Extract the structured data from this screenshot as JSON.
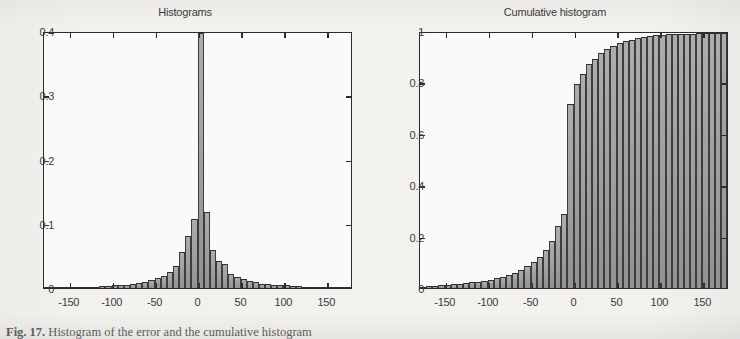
{
  "figure": {
    "caption_label": "Fig. 17.",
    "caption_text": "Histogram of the error and the cumulative histogram"
  },
  "panels": [
    {
      "id": "histograms",
      "title": "Histograms",
      "y_ticks": [
        "0.4",
        "0.3",
        "0.2",
        "0.1",
        "0"
      ],
      "x_ticks": [
        "-150",
        "-100",
        "-50",
        "0",
        "50",
        "100",
        "150"
      ]
    },
    {
      "id": "cumulative-histogram",
      "title": "Cumulative histogram",
      "y_ticks": [
        "1",
        "0.8",
        "0.6",
        "0.4",
        "0.2",
        "0"
      ],
      "x_ticks": [
        "-150",
        "-100",
        "-50",
        "0",
        "50",
        "100",
        "150"
      ]
    }
  ],
  "colors": {
    "bar_fill": "#9b9b9b",
    "bar_edge": "#2e2e2e",
    "axis": "#2b2b2b",
    "paper": "#f3f1ee"
  },
  "chart_data": [
    {
      "type": "bar",
      "title": "Histograms",
      "xlabel": "",
      "ylabel": "",
      "xlim": [
        -180,
        180
      ],
      "ylim": [
        0,
        0.4
      ],
      "grid": false,
      "legend": null,
      "bin_width": 7.2,
      "note": "Central bin is clipped by the axis limit (value exceeds 0.4)",
      "x": [
        -176.4,
        -169.2,
        -162.0,
        -154.8,
        -147.6,
        -140.4,
        -133.2,
        -126.0,
        -118.8,
        -111.6,
        -104.4,
        -97.2,
        -90.0,
        -82.8,
        -75.6,
        -68.4,
        -61.2,
        -54.0,
        -46.8,
        -39.6,
        -32.4,
        -25.2,
        -18.0,
        -10.8,
        -3.6,
        3.6,
        10.8,
        18.0,
        25.2,
        32.4,
        39.6,
        46.8,
        54.0,
        61.2,
        68.4,
        75.6,
        82.8,
        90.0,
        97.2,
        104.4,
        111.6,
        118.8,
        126.0,
        133.2,
        140.4,
        147.6,
        154.8,
        162.0,
        169.2,
        176.4
      ],
      "values": [
        0.001,
        0.001,
        0.001,
        0.001,
        0.001,
        0.002,
        0.002,
        0.002,
        0.002,
        0.003,
        0.003,
        0.004,
        0.004,
        0.005,
        0.006,
        0.008,
        0.01,
        0.013,
        0.016,
        0.019,
        0.025,
        0.035,
        0.056,
        0.082,
        0.108,
        0.4,
        0.12,
        0.06,
        0.043,
        0.038,
        0.022,
        0.017,
        0.014,
        0.011,
        0.009,
        0.007,
        0.006,
        0.005,
        0.004,
        0.004,
        0.003,
        0.003,
        0.002,
        0.002,
        0.002,
        0.002,
        0.001,
        0.001,
        0.001,
        0.001
      ]
    },
    {
      "type": "bar",
      "title": "Cumulative histogram",
      "xlabel": "",
      "ylabel": "",
      "xlim": [
        -180,
        180
      ],
      "ylim": [
        0,
        1
      ],
      "grid": false,
      "legend": null,
      "bin_width": 7.2,
      "x": [
        -176.4,
        -169.2,
        -162.0,
        -154.8,
        -147.6,
        -140.4,
        -133.2,
        -126.0,
        -118.8,
        -111.6,
        -104.4,
        -97.2,
        -90.0,
        -82.8,
        -75.6,
        -68.4,
        -61.2,
        -54.0,
        -46.8,
        -39.6,
        -32.4,
        -25.2,
        -18.0,
        -10.8,
        -3.6,
        3.6,
        10.8,
        18.0,
        25.2,
        32.4,
        39.6,
        46.8,
        54.0,
        61.2,
        68.4,
        75.6,
        82.8,
        90.0,
        97.2,
        104.4,
        111.6,
        118.8,
        126.0,
        133.2,
        140.4,
        147.6,
        154.8,
        162.0,
        169.2,
        176.4
      ],
      "values": [
        0.004,
        0.006,
        0.008,
        0.01,
        0.012,
        0.014,
        0.016,
        0.019,
        0.022,
        0.025,
        0.029,
        0.033,
        0.038,
        0.044,
        0.051,
        0.06,
        0.071,
        0.085,
        0.102,
        0.122,
        0.148,
        0.185,
        0.245,
        0.29,
        0.72,
        0.8,
        0.84,
        0.878,
        0.9,
        0.92,
        0.938,
        0.95,
        0.96,
        0.968,
        0.974,
        0.98,
        0.985,
        0.988,
        0.991,
        0.993,
        0.995,
        0.996,
        0.997,
        0.998,
        0.998,
        0.999,
        0.999,
        1.0,
        1.0,
        1.0
      ]
    }
  ]
}
